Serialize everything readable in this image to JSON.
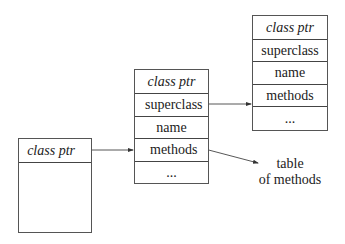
{
  "diagram": {
    "objects": [
      {
        "id": "instance",
        "cells": [
          "class ptr",
          ""
        ]
      },
      {
        "id": "class",
        "cells": [
          "class ptr",
          "superclass",
          "name",
          "methods",
          "..."
        ]
      },
      {
        "id": "superclass",
        "cells": [
          "class ptr",
          "superclass",
          "name",
          "methods",
          "..."
        ]
      }
    ],
    "arrows": [
      {
        "from": "instance.class ptr",
        "to": "class"
      },
      {
        "from": "class.superclass",
        "to": "superclass"
      },
      {
        "from": "class.methods",
        "to": "table of methods"
      }
    ],
    "table_label": {
      "line1": "table",
      "line2": "of methods"
    }
  }
}
